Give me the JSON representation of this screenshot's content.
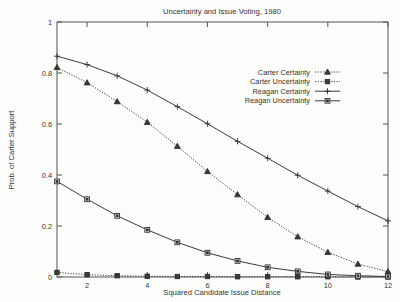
{
  "chart_data": {
    "type": "line",
    "title": "Uncertainty and Issue Voting, 1980",
    "xlabel": "Squared Candidate Issue Distance",
    "ylabel": "Prob. of Carter Support",
    "xlim": [
      1,
      12
    ],
    "ylim": [
      0,
      1
    ],
    "xticks": [
      "2",
      "4",
      "6",
      "8",
      "10",
      "12"
    ],
    "xtick_values": [
      2,
      4,
      6,
      8,
      10,
      12
    ],
    "yticks": [
      "0",
      "0.2",
      "0.4",
      "0.6",
      "0.8",
      "1"
    ],
    "ytick_values": [
      0,
      0.2,
      0.4,
      0.6,
      0.8,
      1
    ],
    "grid": false,
    "legend_position": "upper-right-inside",
    "x": [
      1,
      2,
      3,
      4,
      5,
      6,
      7,
      8,
      9,
      10,
      11,
      12
    ],
    "series": [
      {
        "name": "Carter Certainty",
        "marker": "triangle",
        "line_style": "dotted",
        "values": [
          0.822,
          0.762,
          0.688,
          0.607,
          0.513,
          0.414,
          0.323,
          0.234,
          0.158,
          0.097,
          0.051,
          0.021
        ]
      },
      {
        "name": "Carter Uncertainty",
        "marker": "filled-square",
        "line_style": "dotted",
        "values": [
          0.018,
          0.009,
          0.005,
          0.003,
          0.002,
          0.002,
          0.001,
          0.001,
          0.001,
          0.001,
          0.0,
          0.0
        ]
      },
      {
        "name": "Reagan Certainty",
        "marker": "plus",
        "line_style": "solid",
        "values": [
          0.866,
          0.833,
          0.789,
          0.733,
          0.668,
          0.601,
          0.532,
          0.466,
          0.399,
          0.337,
          0.276,
          0.22
        ]
      },
      {
        "name": "Reagan Uncertainty",
        "marker": "open-square",
        "line_style": "solid",
        "values": [
          0.375,
          0.305,
          0.24,
          0.185,
          0.136,
          0.095,
          0.063,
          0.038,
          0.022,
          0.01,
          0.005,
          0.002
        ]
      }
    ]
  }
}
